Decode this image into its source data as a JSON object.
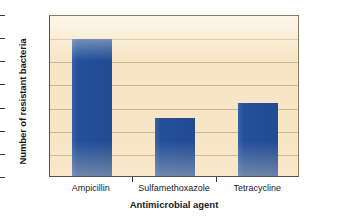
{
  "chart_data": {
    "type": "bar",
    "title": "",
    "xlabel": "Antimicrobial agent",
    "ylabel": "Number of resistant bacteria",
    "categories": [
      "Ampicillin",
      "Sulfamethoxazole",
      "Tetracycline"
    ],
    "values": [
      59,
      25,
      31.5
    ],
    "ylim": [
      0,
      70
    ],
    "yticks": [
      0,
      10,
      20,
      30,
      40,
      50,
      60,
      70
    ],
    "ytick_labels": [
      "0",
      "10",
      "20",
      "30",
      "40",
      "50",
      "60",
      "70"
    ],
    "grid": true,
    "legend": "none",
    "series": [
      {
        "name": "Number of resistant bacteria",
        "values": [
          59,
          25,
          31.5
        ]
      }
    ]
  },
  "style": {
    "bar_color": "#23509a",
    "plot_background": "#f7e5c6",
    "gridline_color": "#c9b694",
    "axis_color": "#55504a",
    "page_background": "#ffffff",
    "text_color": "#1a1a1a"
  }
}
